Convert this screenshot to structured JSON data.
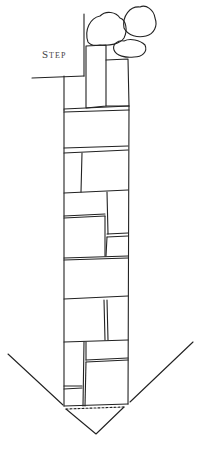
{
  "diagram": {
    "labels": {
      "step": "Step"
    },
    "elements": {
      "shrubs": [
        "shrub-top-left",
        "shrub-top-right",
        "shrub-lower-right"
      ],
      "path": "flagstone-path",
      "arrow": "downward-chevron"
    },
    "colors": {
      "line": "#222222",
      "background": "#ffffff",
      "label": "#444444"
    }
  }
}
